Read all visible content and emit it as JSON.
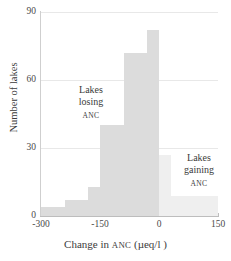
{
  "chart_data": {
    "type": "bar",
    "title": "",
    "subtitle": "",
    "xlabel": "Change in ANC (µeq/l )",
    "ylabel": "Number of lakes",
    "xlim": [
      -300,
      150
    ],
    "ylim": [
      0,
      90
    ],
    "grid": true,
    "legend": "none",
    "bin_width": 30,
    "bin_edges": [
      -300,
      -270,
      -240,
      -210,
      -180,
      -150,
      -120,
      -90,
      -60,
      -30,
      0,
      30,
      60,
      90,
      120,
      150
    ],
    "categories": [
      "-300 to -270",
      "-270 to -240",
      "-240 to -210",
      "-210 to -180",
      "-180 to -150",
      "-150 to -120",
      "-120 to -90",
      "-90 to -60",
      "-60 to -30",
      "-30 to 0",
      "0 to 30",
      "30 to 60",
      "60 to 90",
      "90 to 120",
      "120 to 150"
    ],
    "values": [
      4,
      4,
      7,
      7,
      13,
      40,
      40,
      72,
      72,
      82,
      27,
      9,
      9,
      9,
      9
    ],
    "bar_groups": [
      {
        "name": "Lakes losing ANC",
        "color": "#dcdcdc",
        "x_range": [
          -300,
          0
        ]
      },
      {
        "name": "Lakes gaining ANC",
        "color": "#efefef",
        "x_range": [
          0,
          150
        ]
      }
    ],
    "x_ticks": [
      -300,
      -150,
      0,
      150
    ],
    "x_tick_labels": [
      "-300",
      "-150",
      "0",
      "150"
    ],
    "y_ticks": [
      0,
      30,
      60,
      90
    ],
    "y_tick_labels": [
      "0",
      "30",
      "60",
      "90"
    ],
    "annotations": [
      {
        "id": "losing",
        "line1": "Lakes",
        "line2": "losing",
        "line3": "ANC"
      },
      {
        "id": "gaining",
        "line1": "Lakes",
        "line2": "gaining",
        "line3": "ANC"
      }
    ]
  },
  "axes": {
    "x_title_main": "Change in ",
    "x_title_smallcaps": "ANC",
    "x_title_units": " (µeq/l )",
    "y_title": "Number of lakes"
  },
  "colors": {
    "bar_losing": "#dcdcdc",
    "bar_gaining": "#efefef",
    "gridline": "#e8e8e8",
    "axis": "#bdbdbd",
    "text": "#3b3b3b",
    "background": "#ffffff"
  }
}
